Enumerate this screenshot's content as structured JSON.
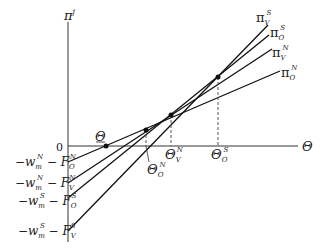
{
  "diagram": {
    "y_axis_label": {
      "base": "π",
      "sup": "j"
    },
    "x_axis_label": "Θ",
    "origin_label": "0",
    "intercepts": [
      {
        "id": "O_N",
        "text": "−w",
        "sub1": "m",
        "sup1": "N",
        "mid": " − F",
        "sub2": "O",
        "sup2": "N"
      },
      {
        "id": "V_N",
        "text": "−w",
        "sub1": "m",
        "sup1": "N",
        "mid": " − F",
        "sub2": "V",
        "sup2": "N"
      },
      {
        "id": "O_S",
        "text": "−w",
        "sub1": "m",
        "sup1": "S",
        "mid": " − F",
        "sub2": "O",
        "sup2": "S"
      },
      {
        "id": "V_S",
        "text": "−w",
        "sub1": "m",
        "sup1": "S",
        "mid": " − F",
        "sub2": "V",
        "sup2": "S"
      }
    ],
    "lines": [
      {
        "label": "π",
        "sub": "V",
        "sup": "S"
      },
      {
        "label": "π",
        "sub": "O",
        "sup": "S"
      },
      {
        "label": "π",
        "sub": "V",
        "sup": "N"
      },
      {
        "label": "π",
        "sub": "O",
        "sup": "N"
      }
    ],
    "thresholds": [
      {
        "base": "Θ",
        "underline": true,
        "sub": "",
        "sup": ""
      },
      {
        "base": "Θ",
        "sub": "O",
        "sup": "N"
      },
      {
        "base": "Θ",
        "sub": "V",
        "sup": "N"
      },
      {
        "base": "Θ",
        "sub": "O",
        "sup": "S"
      }
    ]
  }
}
